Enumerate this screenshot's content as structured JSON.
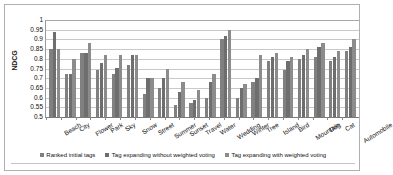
{
  "chart_data": {
    "type": "bar",
    "title": "",
    "xlabel": "",
    "ylabel": "NDCG",
    "ylim": [
      0.5,
      1.0
    ],
    "ytick_step": 0.05,
    "ytick_labels": [
      "1",
      "0.95",
      "0.9",
      "0.85",
      "0.8",
      "0.75",
      "0.7",
      "0.65",
      "0.6",
      "0.55",
      "0.5"
    ],
    "grid": true,
    "legend_position": "bottom",
    "categories": [
      "Beach",
      "City",
      "Flower",
      "Park",
      "Sky",
      "Snow",
      "Street",
      "Summer",
      "Sunset",
      "Travel",
      "Water",
      "Wedding",
      "Winter",
      "Tree",
      "Island",
      "Bird",
      "Mountain",
      "Dog",
      "Cat",
      "Automobile"
    ],
    "series": [
      {
        "name": "Ranked initial tags",
        "color": "#808080",
        "values": [
          0.85,
          0.72,
          0.83,
          0.74,
          0.72,
          0.77,
          0.62,
          0.65,
          0.56,
          0.57,
          0.6,
          0.9,
          0.6,
          0.68,
          0.79,
          0.74,
          0.8,
          0.81,
          0.79,
          0.84
        ]
      },
      {
        "name": "Tag expanding without weighted voting",
        "color": "#6e6e6e",
        "values": [
          0.94,
          0.72,
          0.83,
          0.78,
          0.755,
          0.82,
          0.7,
          0.7,
          0.63,
          0.59,
          0.68,
          0.92,
          0.65,
          0.7,
          0.81,
          0.79,
          0.82,
          0.86,
          0.81,
          0.86
        ]
      },
      {
        "name": "Tag expanding with weighted voting",
        "color": "#8c8c8c",
        "values": [
          0.85,
          0.8,
          0.88,
          0.82,
          0.82,
          0.82,
          0.7,
          0.75,
          0.68,
          0.64,
          0.72,
          0.95,
          0.67,
          0.82,
          0.83,
          0.81,
          0.85,
          0.88,
          0.84,
          0.9
        ]
      }
    ]
  },
  "legend": {
    "items": [
      {
        "label": "Ranked initial tags"
      },
      {
        "label": "Tag expanding without weighted voting"
      },
      {
        "label": "Tag expanding with weighted voting"
      }
    ]
  }
}
